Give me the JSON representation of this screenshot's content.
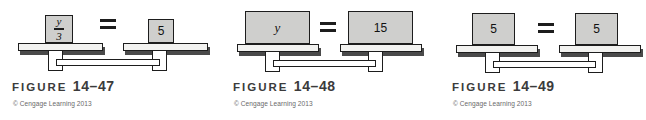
{
  "page": {
    "background_color": "#ffffff",
    "block_fill_color": "#cfcfcd",
    "line_color": "#1d1d1d",
    "caption_color": "#3b3b3b",
    "copyright_color": "#6a6a6a"
  },
  "figures": [
    {
      "id": "figure-14-47",
      "caption_word": "FIGURE",
      "caption_number": "14–47",
      "copyright": "© Cengage Learning 2013",
      "equation": "y/3 = 5",
      "operator": "=",
      "left": {
        "kind": "fraction",
        "numerator": "y",
        "denominator": "3",
        "label": "y/3"
      },
      "right": {
        "kind": "number",
        "label": "5"
      }
    },
    {
      "id": "figure-14-48",
      "caption_word": "FIGURE",
      "caption_number": "14–48",
      "copyright": "© Cengage Learning 2013",
      "equation": "y = 15",
      "operator": "=",
      "left": {
        "kind": "variable",
        "label": "y"
      },
      "right": {
        "kind": "number",
        "label": "15"
      }
    },
    {
      "id": "figure-14-49",
      "caption_word": "FIGURE",
      "caption_number": "14–49",
      "copyright": "© Cengage Learning 2013",
      "equation": "5 = 5",
      "operator": "=",
      "left": {
        "kind": "number",
        "label": "5"
      },
      "right": {
        "kind": "number",
        "label": "5"
      }
    }
  ]
}
